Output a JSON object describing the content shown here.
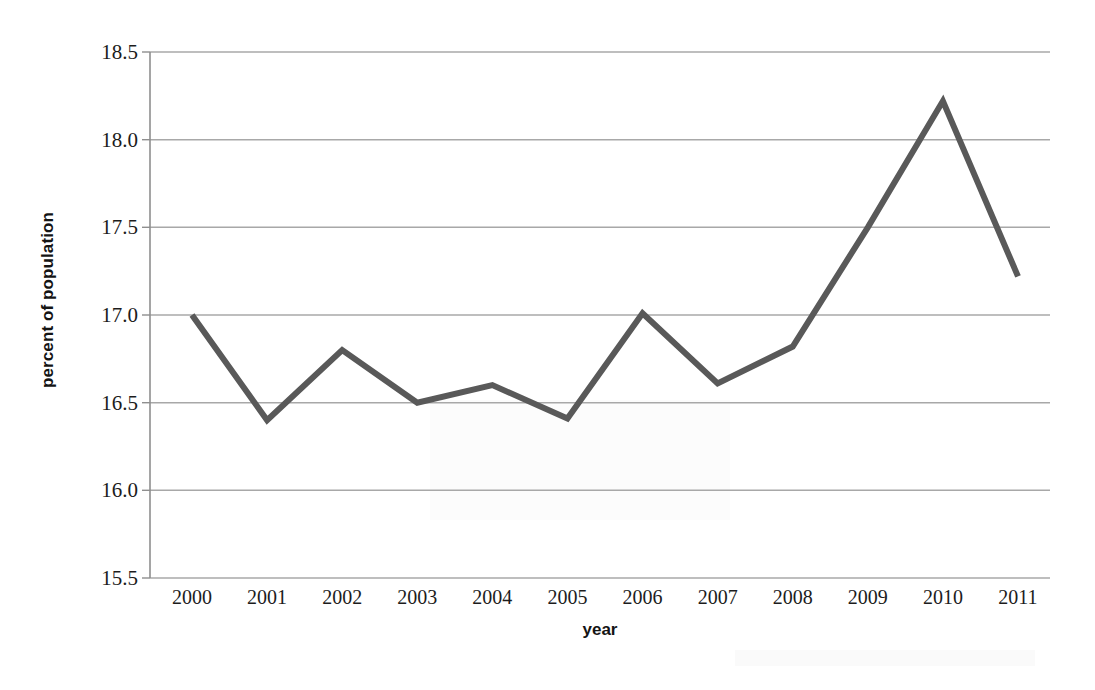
{
  "chart_data": {
    "type": "line",
    "title": "",
    "xlabel": "year",
    "ylabel": "percent of population",
    "categories": [
      "2000",
      "2001",
      "2002",
      "2003",
      "2004",
      "2005",
      "2006",
      "2007",
      "2008",
      "2009",
      "2010",
      "2011"
    ],
    "x": [
      2000,
      2001,
      2002,
      2003,
      2004,
      2005,
      2006,
      2007,
      2008,
      2009,
      2010,
      2011
    ],
    "values": [
      17.0,
      16.4,
      16.8,
      16.5,
      16.6,
      16.41,
      17.01,
      16.61,
      16.82,
      17.5,
      18.22,
      17.22
    ],
    "series": [
      {
        "name": "percent of population",
        "values": [
          17.0,
          16.4,
          16.8,
          16.5,
          16.6,
          16.41,
          17.01,
          16.61,
          16.82,
          17.5,
          18.22,
          17.22
        ]
      }
    ],
    "ylim": [
      15.5,
      18.5
    ],
    "ytick_labels": [
      "18.5",
      "18.0",
      "17.5",
      "17.0",
      "16.5",
      "16.0",
      "15.5"
    ],
    "ytick_values": [
      18.5,
      18.0,
      17.5,
      17.0,
      16.5,
      16.0,
      15.5
    ],
    "grid": true,
    "grid_axis": "y",
    "legend": false,
    "legend_position": "none",
    "line_color": "#595959",
    "grid_color": "#a6a6a6",
    "axis_color": "#8c8c8c",
    "background_color": "#ffffff",
    "line_width": 6
  }
}
